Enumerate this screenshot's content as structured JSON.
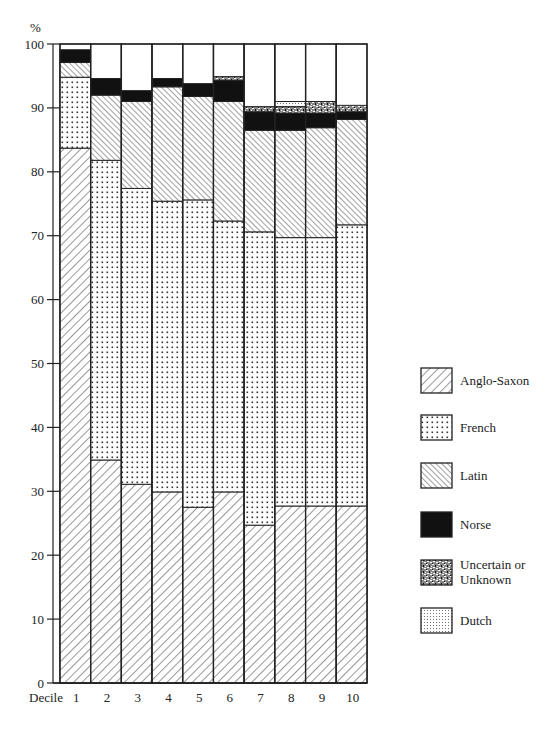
{
  "chart_data": {
    "type": "bar",
    "stacked": true,
    "title": "",
    "xlabel": "Decile",
    "ylabel": "%",
    "ylim": [
      0,
      100
    ],
    "yticks": [
      0,
      10,
      20,
      30,
      40,
      50,
      60,
      70,
      80,
      90,
      100
    ],
    "grid": false,
    "legend_position": "right",
    "categories": [
      "1",
      "2",
      "3",
      "4",
      "5",
      "6",
      "7",
      "8",
      "9",
      "10"
    ],
    "series": [
      {
        "name": "Anglo-Saxon",
        "pattern": "diagonal-backslash",
        "values": [
          83.7,
          34.9,
          31.1,
          29.9,
          27.5,
          29.9,
          24.7,
          27.7,
          27.7,
          27.7
        ]
      },
      {
        "name": "French",
        "pattern": "dots",
        "values": [
          11.1,
          46.9,
          46.3,
          45.5,
          48.1,
          42.4,
          45.9,
          42.0,
          42.0,
          44.0
        ]
      },
      {
        "name": "Latin",
        "pattern": "diagonal-slash",
        "values": [
          2.3,
          10.2,
          13.6,
          17.9,
          16.2,
          18.7,
          15.9,
          16.8,
          17.2,
          16.5
        ]
      },
      {
        "name": "Norse",
        "pattern": "solid-black",
        "values": [
          2.0,
          2.6,
          1.7,
          1.3,
          2.0,
          3.3,
          2.9,
          2.7,
          2.3,
          1.2
        ]
      },
      {
        "name": "Uncertain or Unknown",
        "pattern": "speckle",
        "values": [
          0,
          0,
          0,
          0,
          0,
          0.6,
          0.8,
          1.0,
          1.8,
          1.0
        ]
      },
      {
        "name": "Dutch",
        "pattern": "fine-dots",
        "values": [
          0,
          0,
          0,
          0,
          0,
          0,
          0,
          0.8,
          0,
          0
        ]
      }
    ]
  },
  "axis": {
    "y_unit": "%",
    "x_label": "Decile"
  },
  "legend": [
    {
      "label_lines": [
        "Anglo-Saxon"
      ]
    },
    {
      "label_lines": [
        "French"
      ]
    },
    {
      "label_lines": [
        "Latin"
      ]
    },
    {
      "label_lines": [
        "Norse"
      ]
    },
    {
      "label_lines": [
        "Uncertain or",
        "Unknown"
      ]
    },
    {
      "label_lines": [
        "Dutch"
      ]
    }
  ]
}
